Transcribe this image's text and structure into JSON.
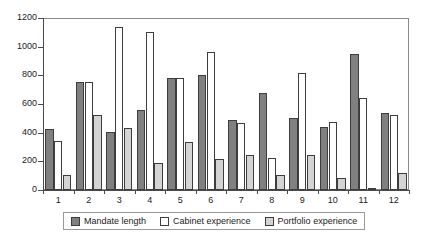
{
  "chart_data": {
    "type": "bar",
    "title": "",
    "subtitle": "",
    "xlabel": "",
    "ylabel": "",
    "categories": [
      "1",
      "2",
      "3",
      "4",
      "5",
      "6",
      "7",
      "8",
      "9",
      "10",
      "11",
      "12"
    ],
    "ylim": [
      0,
      1200
    ],
    "yticks": [
      0,
      200,
      400,
      600,
      800,
      1000,
      1200
    ],
    "ytick_labels": [
      "0",
      "200",
      "400",
      "600",
      "800",
      "1000",
      "1200"
    ],
    "grid": false,
    "legend_position": "bottom",
    "series": [
      {
        "name": "Mandate length",
        "color": "#808080",
        "values": [
          425,
          755,
          405,
          560,
          780,
          805,
          490,
          680,
          505,
          440,
          950,
          535
        ]
      },
      {
        "name": "Cabinet experience",
        "color": "#ffffff",
        "values": [
          340,
          755,
          1135,
          1105,
          780,
          960,
          465,
          225,
          815,
          475,
          640,
          520
        ]
      },
      {
        "name": "Portfolio experience",
        "color": "#d4d4d4",
        "values": [
          105,
          520,
          430,
          190,
          335,
          215,
          245,
          105,
          245,
          85,
          15,
          120
        ]
      }
    ]
  }
}
